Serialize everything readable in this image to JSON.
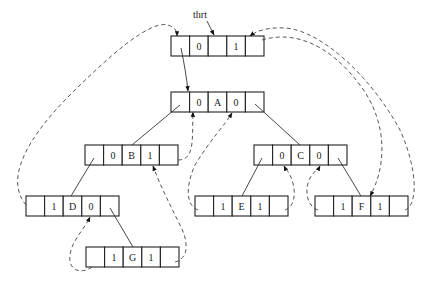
{
  "diagram": {
    "head_pointer_label": "thrt",
    "cell_width": 18.6,
    "cell_height": 20,
    "nodes": [
      {
        "id": "head",
        "x": 171,
        "y": 36,
        "cells": [
          "",
          "0",
          "",
          "1",
          ""
        ]
      },
      {
        "id": "A",
        "x": 171,
        "y": 92,
        "cells": [
          "",
          "0",
          "A",
          "0",
          ""
        ]
      },
      {
        "id": "B",
        "x": 85,
        "y": 145,
        "cells": [
          "",
          "0",
          "B",
          "1",
          ""
        ]
      },
      {
        "id": "C",
        "x": 254,
        "y": 145,
        "cells": [
          "",
          "0",
          "C",
          "0",
          ""
        ]
      },
      {
        "id": "D",
        "x": 26,
        "y": 196,
        "cells": [
          "",
          "1",
          "D",
          "0",
          ""
        ]
      },
      {
        "id": "E",
        "x": 195,
        "y": 196,
        "cells": [
          "",
          "1",
          "E",
          "1",
          ""
        ]
      },
      {
        "id": "F",
        "x": 315,
        "y": 196,
        "cells": [
          "",
          "1",
          "F",
          "1",
          ""
        ]
      },
      {
        "id": "G",
        "x": 86,
        "y": 247,
        "cells": [
          "",
          "1",
          "G",
          "1",
          ""
        ]
      }
    ],
    "tree_edges": [
      {
        "from": "head.lchild",
        "to": "A"
      },
      {
        "from": "A.lchild",
        "to": "B"
      },
      {
        "from": "A.rchild",
        "to": "C"
      },
      {
        "from": "B.lchild",
        "to": "D"
      },
      {
        "from": "C.lchild",
        "to": "E"
      },
      {
        "from": "C.rchild",
        "to": "F"
      },
      {
        "from": "D.rchild",
        "to": "G"
      }
    ],
    "threads": [
      {
        "from": "D.lchild",
        "to": "head",
        "kind": "predecessor"
      },
      {
        "from": "G.lchild",
        "to": "D",
        "kind": "predecessor"
      },
      {
        "from": "G.rchild",
        "to": "B",
        "kind": "successor"
      },
      {
        "from": "B.rchild",
        "to": "A",
        "kind": "successor"
      },
      {
        "from": "E.lchild",
        "to": "A",
        "kind": "predecessor"
      },
      {
        "from": "E.rchild",
        "to": "C",
        "kind": "successor"
      },
      {
        "from": "F.lchild",
        "to": "C",
        "kind": "predecessor"
      },
      {
        "from": "F.rchild",
        "to": "head",
        "kind": "successor"
      },
      {
        "from": "head.rchild",
        "to": "F",
        "kind": "last-node"
      }
    ],
    "colors": {
      "line": "#222222",
      "thread": "#444444",
      "background": "#ffffff"
    }
  }
}
